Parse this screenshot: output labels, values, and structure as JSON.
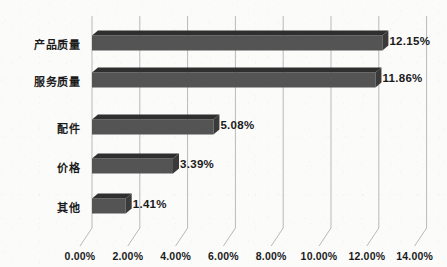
{
  "chart_data": {
    "type": "bar",
    "orientation": "horizontal",
    "title": "",
    "subtitle": "",
    "xlabel": "",
    "ylabel": "",
    "categories": [
      "产品质量",
      "服务质量",
      "配件",
      "价格",
      "其他"
    ],
    "values": [
      12.15,
      11.86,
      5.08,
      3.39,
      1.41
    ],
    "data_labels": [
      "12.15%",
      "11.86%",
      "5.08%",
      "3.39%",
      "1.41%"
    ],
    "xlim": [
      0,
      14
    ],
    "xtick_values": [
      0,
      2,
      4,
      6,
      8,
      10,
      12,
      14
    ],
    "xtick_labels": [
      "0.00%",
      "2.00%",
      "4.00%",
      "6.00%",
      "8.00%",
      "10.00%",
      "12.00%",
      "14.00%"
    ],
    "grid": true,
    "grid_axis": "x",
    "legend": false,
    "legend_position": "none",
    "style": "3d",
    "series": [
      {
        "name": "占比",
        "values": [
          12.15,
          11.86,
          5.08,
          3.39,
          1.41
        ]
      }
    ]
  },
  "colors": {
    "bar_front": "#545454",
    "bar_top": "#2f2f2f",
    "bar_side": "#3a3a3a",
    "gridline": "#b9b9b9",
    "background": "#fbfbfa",
    "text": "#1a1a1a"
  }
}
